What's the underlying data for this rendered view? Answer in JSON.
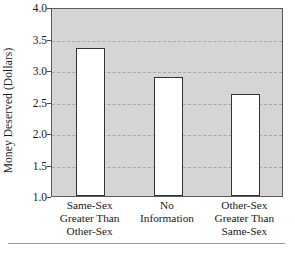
{
  "chart_data": {
    "type": "bar",
    "title": "",
    "xlabel": "",
    "ylabel": "Money Deserved (Dollars)",
    "ylim": [
      1.0,
      4.0
    ],
    "yticks": [
      "4.0",
      "3.5",
      "3.0",
      "2.5",
      "2.0",
      "1.5",
      "1.0"
    ],
    "ytick_values": [
      4.0,
      3.5,
      3.0,
      2.5,
      2.0,
      1.5,
      1.0
    ],
    "grid": "horizontal-dashed",
    "legend": "none",
    "categories": [
      "Same-Sex Greater Than Other-Sex",
      "No Information",
      "Other-Sex Greater Than Same-Sex"
    ],
    "category_lines": [
      [
        "Same-Sex",
        "Greater Than",
        "Other-Sex"
      ],
      [
        "No",
        "Information"
      ],
      [
        "Other-Sex",
        "Greater Than",
        "Same-Sex"
      ]
    ],
    "values": [
      3.35,
      2.89,
      2.62
    ],
    "bar_fill": "#ffffff",
    "bar_edge": "#333333",
    "plot_background": "#d5d5d5",
    "gridline_color": "#a8a8a8",
    "axis_color": "#5a5a5a"
  }
}
